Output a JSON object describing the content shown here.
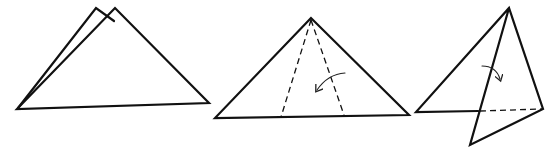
{
  "diagram": {
    "colors": {
      "line": "#111111",
      "background": "#ffffff"
    },
    "steps": [
      {
        "id": "step-1",
        "description": "Folded triangle with two layers offset at the apex",
        "back_layer": [
          [
            17,
            109
          ],
          [
            96,
            8
          ],
          [
            116,
            22
          ]
        ],
        "front_layer": [
          [
            17,
            109
          ],
          [
            115,
            8
          ],
          [
            209,
            103
          ]
        ]
      },
      {
        "id": "step-2",
        "description": "Triangle with two dashed fold lines from apex; curved arrow indicates folding the right section to the left",
        "outline": [
          [
            311,
            18
          ],
          [
            215,
            118
          ],
          [
            409,
            115
          ]
        ],
        "fold_lines": [
          [
            [
              311,
              18
            ],
            [
              281,
              118
            ]
          ],
          [
            [
              311,
              18
            ],
            [
              344,
              116
            ]
          ]
        ],
        "arrow": {
          "from": [
            345,
            73
          ],
          "to": [
            316,
            90
          ],
          "direction": "left-down"
        }
      },
      {
        "id": "step-3",
        "description": "Right flap folded down past the base; dashed line shows hidden base edge; curved arrow indicates fold",
        "outline": [
          [
            416,
            112
          ],
          [
            509,
            8
          ],
          [
            543,
            109
          ],
          [
            470,
            145
          ]
        ],
        "fold_edge": [
          [
            509,
            8
          ],
          [
            470,
            145
          ]
        ],
        "dashed_base": [
          [
            478,
            111
          ],
          [
            543,
            109
          ]
        ],
        "arrow": {
          "from": [
            482,
            66
          ],
          "to": [
            500,
            79
          ],
          "direction": "right-down"
        }
      }
    ]
  }
}
